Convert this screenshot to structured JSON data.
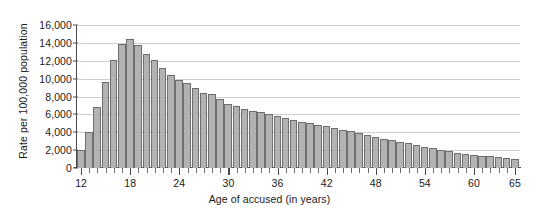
{
  "chart_data": {
    "type": "bar",
    "title": "",
    "xlabel": "Age of accused (in years)",
    "ylabel": "Rate per 100,000 population",
    "xlim": [
      11.5,
      65.5
    ],
    "ylim": [
      0,
      16000
    ],
    "grid": true,
    "legend": false,
    "bar_color": "#b2b2b2",
    "bar_border_color": "#6e6e6e",
    "grid_color": "#cfcfcf",
    "axis_color": "#4a4a4a",
    "ytick_labels": [
      "16,000",
      "14,000",
      "12,000",
      "10,000",
      "8,000",
      "6,000",
      "4,000",
      "2,000",
      "0"
    ],
    "ytick_values": [
      16000,
      14000,
      12000,
      10000,
      8000,
      6000,
      4000,
      2000,
      0
    ],
    "xtick_labels": [
      "12",
      "18",
      "24",
      "30",
      "36",
      "42",
      "48",
      "54",
      "60",
      "65"
    ],
    "xtick_values": [
      12,
      18,
      24,
      30,
      36,
      42,
      48,
      54,
      60,
      65
    ],
    "categories": [
      12,
      13,
      14,
      15,
      16,
      17,
      18,
      19,
      20,
      21,
      22,
      23,
      24,
      25,
      26,
      27,
      28,
      29,
      30,
      31,
      32,
      33,
      34,
      35,
      36,
      37,
      38,
      39,
      40,
      41,
      42,
      43,
      44,
      45,
      46,
      47,
      48,
      49,
      50,
      51,
      52,
      53,
      54,
      55,
      56,
      57,
      58,
      59,
      60,
      61,
      62,
      63,
      64,
      65
    ],
    "values": [
      2000,
      4000,
      6800,
      9600,
      12100,
      13900,
      14400,
      13800,
      12800,
      12100,
      11150,
      10450,
      9800,
      9500,
      8900,
      8400,
      8250,
      7700,
      7150,
      6900,
      6600,
      6400,
      6250,
      6000,
      5850,
      5600,
      5400,
      5200,
      5000,
      4800,
      4650,
      4500,
      4300,
      4100,
      3900,
      3700,
      3500,
      3300,
      3100,
      2950,
      2750,
      2600,
      2400,
      2250,
      2000,
      1850,
      1700,
      1600,
      1500,
      1400,
      1350,
      1250,
      1150,
      1000
    ]
  }
}
